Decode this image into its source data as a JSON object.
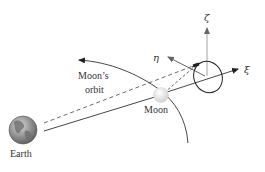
{
  "diagram": {
    "labels": {
      "earth": "Earth",
      "moon": "Moon",
      "orbit_line1": "Moon’s",
      "orbit_line2": "orbit",
      "xi": "ξ",
      "eta": "η",
      "zeta": "ζ"
    },
    "colors": {
      "line": "#333333",
      "axis_gray": "#999999",
      "earth_fill": "#8a8a8a",
      "moon_fill": "#e6e6e6"
    }
  }
}
